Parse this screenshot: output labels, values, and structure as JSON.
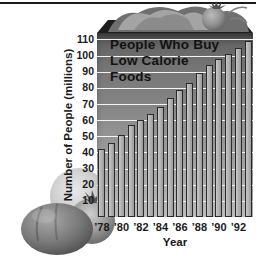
{
  "chart_data": {
    "type": "bar",
    "title": "People Who Buy Low Calorie Foods",
    "title_lines": [
      "People Who Buy",
      "Low Calorie",
      "Foods"
    ],
    "xlabel": "Year",
    "ylabel": "Number of People (millions)",
    "x": [
      1978,
      1979,
      1980,
      1981,
      1982,
      1983,
      1984,
      1985,
      1986,
      1987,
      1988,
      1989,
      1990,
      1991,
      1992,
      1993
    ],
    "values": [
      42,
      46,
      51,
      57,
      60,
      64,
      68,
      74,
      79,
      83,
      89,
      94,
      98,
      101,
      105,
      109
    ],
    "xtick_labels": [
      "’78",
      "’80",
      "’82",
      "’84",
      "’86",
      "’88",
      "’90",
      "’92"
    ],
    "yticks": [
      110,
      100,
      90,
      80,
      70,
      60,
      50,
      40,
      30,
      20,
      10
    ],
    "ylim": [
      0,
      114
    ],
    "grid": true,
    "legend": null
  },
  "decorations": {
    "top_garnish": "lettuce-and-tomato-icon",
    "left_fruit": "grapefruit-icon",
    "bottom_left": "tomatoes-icon"
  },
  "colors": {
    "frame_line": "#1a1a1a",
    "box_top": "#1d1d1d",
    "plot_top": "#5d5d5d",
    "plot_bottom": "#bcbcbc",
    "gridline": "#f4f4f4",
    "bar_fill": "#b2b2b2",
    "bar_outline": "#2b2b2b",
    "text": "#141414"
  }
}
